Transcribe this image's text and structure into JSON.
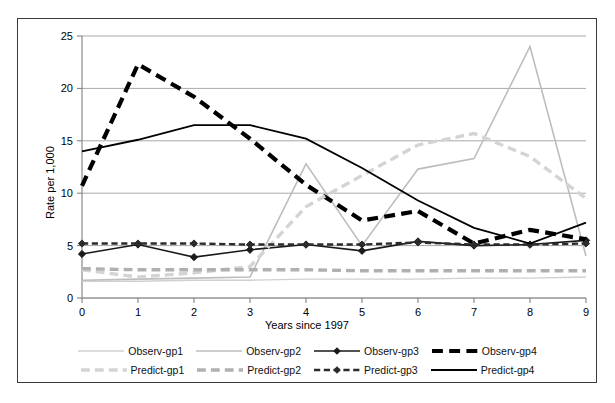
{
  "chart_data": {
    "type": "line",
    "title": "",
    "xlabel": "Years since 1997",
    "ylabel": "Rate per 1,000",
    "x": [
      0,
      1,
      2,
      3,
      4,
      5,
      6,
      7,
      8,
      9
    ],
    "xlim": [
      0,
      9
    ],
    "ylim": [
      0,
      25
    ],
    "yticks": [
      0,
      5,
      10,
      15,
      20,
      25
    ],
    "xticks": [
      0,
      1,
      2,
      3,
      4,
      5,
      6,
      7,
      8,
      9
    ],
    "grid": "horizontal",
    "legend_position": "bottom",
    "series": [
      {
        "name": "Observ-gp1",
        "values": [
          1.6,
          1.6,
          1.7,
          1.7,
          1.8,
          1.8,
          1.8,
          1.9,
          1.9,
          2.0
        ],
        "color": "#d0d0d0",
        "style": "solid",
        "width": 1.4,
        "marker": "none"
      },
      {
        "name": "Observ-gp2",
        "values": [
          1.7,
          1.8,
          1.9,
          2.0,
          12.8,
          5.0,
          12.3,
          13.3,
          24.0,
          4.0
        ],
        "color": "#bdbdbd",
        "style": "solid",
        "width": 1.6,
        "marker": "none"
      },
      {
        "name": "Observ-gp3",
        "values": [
          4.2,
          5.1,
          3.9,
          4.6,
          5.1,
          4.5,
          5.4,
          5.0,
          5.1,
          5.5
        ],
        "color": "#1a1a1a",
        "style": "solid",
        "width": 1.6,
        "marker": "diamond"
      },
      {
        "name": "Observ-gp4",
        "values": [
          10.7,
          22.3,
          19.2,
          15.2,
          10.8,
          7.4,
          8.3,
          5.2,
          6.5,
          5.6
        ],
        "color": "#000000",
        "style": "dashed",
        "width": 4.2,
        "marker": "none"
      },
      {
        "name": "Predict-gp1",
        "values": [
          2.7,
          2.0,
          2.4,
          3.0,
          8.7,
          11.7,
          14.6,
          15.7,
          13.5,
          9.5
        ],
        "color": "#d4d4d4",
        "style": "dashed",
        "width": 3.4,
        "marker": "none"
      },
      {
        "name": "Predict-gp2",
        "values": [
          2.8,
          2.7,
          2.7,
          2.7,
          2.7,
          2.6,
          2.6,
          2.6,
          2.6,
          2.6
        ],
        "color": "#b0b0b0",
        "style": "dashed",
        "width": 3.4,
        "marker": "none"
      },
      {
        "name": "Predict-gp3",
        "values": [
          5.2,
          5.2,
          5.2,
          5.1,
          5.1,
          5.1,
          5.3,
          5.1,
          5.1,
          5.2
        ],
        "color": "#2b2b2b",
        "style": "dashed",
        "width": 2.4,
        "marker": "diamond"
      },
      {
        "name": "Predict-gp4",
        "values": [
          14.0,
          15.1,
          16.5,
          16.5,
          15.2,
          12.4,
          9.3,
          6.7,
          5.2,
          7.2
        ],
        "color": "#000000",
        "style": "solid",
        "width": 1.8,
        "marker": "none"
      }
    ]
  },
  "legend": {
    "rows": [
      [
        "Observ-gp1",
        "Observ-gp2",
        "Observ-gp3",
        "Observ-gp4"
      ],
      [
        "Predict-gp1",
        "Predict-gp2",
        "Predict-gp3",
        "Predict-gp4"
      ]
    ]
  },
  "axis": {
    "x_title": "Years since 1997",
    "y_title": "Rate per 1,000"
  }
}
